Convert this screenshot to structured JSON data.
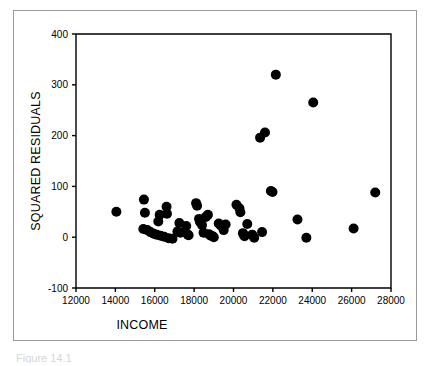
{
  "figure": {
    "caption_partial": "Figure 14.1",
    "frame_color": "#9a9a9a",
    "background_color": "#ffffff"
  },
  "chart_data": {
    "type": "scatter",
    "title": "",
    "xlabel": "INCOME",
    "ylabel": "SQUARED RESIDUALS",
    "xlim": [
      12000,
      28000
    ],
    "ylim": [
      -100,
      400
    ],
    "xticks": [
      12000,
      14000,
      16000,
      18000,
      20000,
      22000,
      24000,
      26000,
      28000
    ],
    "yticks": [
      -100,
      0,
      100,
      200,
      300,
      400
    ],
    "xtick_labels": [
      "12000",
      "14000",
      "16000",
      "18000",
      "20000",
      "22000",
      "24000",
      "26000",
      "28000"
    ],
    "ytick_labels": [
      "-100",
      "0",
      "100",
      "200",
      "300",
      "400"
    ],
    "grid": false,
    "legend": false,
    "marker": "circle",
    "marker_color": "#000000",
    "marker_size": 5,
    "series": [
      {
        "name": "Squared residuals",
        "points": [
          [
            14050,
            50
          ],
          [
            15450,
            74
          ],
          [
            15500,
            48
          ],
          [
            15420,
            16
          ],
          [
            15620,
            14
          ],
          [
            15780,
            10
          ],
          [
            15950,
            7
          ],
          [
            16100,
            5
          ],
          [
            16180,
            31
          ],
          [
            16250,
            44
          ],
          [
            16300,
            3
          ],
          [
            16480,
            1
          ],
          [
            16600,
            60
          ],
          [
            16620,
            46
          ],
          [
            16700,
            -2
          ],
          [
            16900,
            -3
          ],
          [
            17150,
            11
          ],
          [
            17250,
            28
          ],
          [
            17300,
            9
          ],
          [
            17600,
            22
          ],
          [
            17680,
            5
          ],
          [
            17720,
            4
          ],
          [
            18100,
            67
          ],
          [
            18150,
            62
          ],
          [
            18250,
            36
          ],
          [
            18300,
            30
          ],
          [
            18400,
            24
          ],
          [
            18480,
            9
          ],
          [
            18600,
            40
          ],
          [
            18700,
            44
          ],
          [
            18750,
            6
          ],
          [
            18850,
            3
          ],
          [
            18950,
            2
          ],
          [
            19000,
            0
          ],
          [
            19250,
            27
          ],
          [
            19350,
            23
          ],
          [
            19500,
            14
          ],
          [
            19600,
            25
          ],
          [
            20150,
            64
          ],
          [
            20300,
            57
          ],
          [
            20350,
            49
          ],
          [
            20480,
            8
          ],
          [
            20520,
            5
          ],
          [
            20560,
            2
          ],
          [
            20700,
            26
          ],
          [
            20950,
            5
          ],
          [
            21050,
            -1
          ],
          [
            21350,
            196
          ],
          [
            21600,
            206
          ],
          [
            21450,
            10
          ],
          [
            21900,
            91
          ],
          [
            21980,
            89
          ],
          [
            22150,
            320
          ],
          [
            23250,
            35
          ],
          [
            23700,
            -1
          ],
          [
            24050,
            265
          ],
          [
            26100,
            17
          ],
          [
            27200,
            88
          ]
        ]
      }
    ]
  }
}
